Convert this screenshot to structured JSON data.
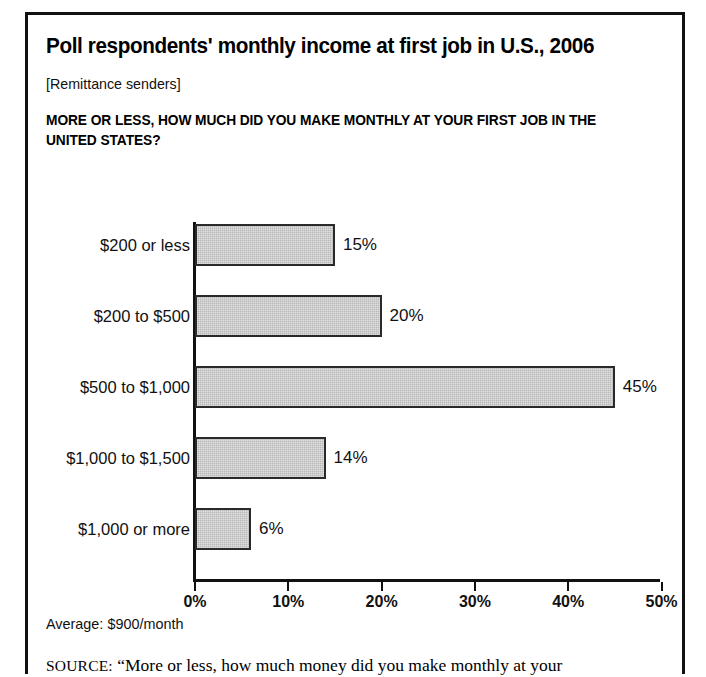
{
  "figure": {
    "title": "Poll respondents' monthly income at first job in U.S., 2006",
    "subtitle": "[Remittance senders]",
    "question": "MORE OR LESS, HOW MUCH DID YOU MAKE MONTHLY AT YOUR FIRST JOB IN THE UNITED STATES?",
    "average_note": "Average: $900/month",
    "source_label": "SOURCE:",
    "source_text": "“More or less, how much money did you make monthly at your"
  },
  "chart_data": {
    "type": "bar",
    "orientation": "horizontal",
    "title": "Poll respondents' monthly income at first job in U.S., 2006",
    "subtitle": "[Remittance senders]",
    "xlabel": "",
    "ylabel": "",
    "xlim": [
      0,
      50
    ],
    "grid": false,
    "legend": false,
    "bar_color": "#b9b9b9",
    "bar_border_color": "#2a2a2a",
    "categories": [
      "$200 or less",
      "$200 to $500",
      "$500 to $1,000",
      "$1,000 to $1,500",
      "$1,000 or more"
    ],
    "values": [
      15,
      20,
      45,
      14,
      6
    ],
    "value_labels": [
      "15%",
      "20%",
      "45%",
      "14%",
      "6%"
    ],
    "xticks": [
      0,
      10,
      20,
      30,
      40,
      50
    ],
    "xtick_labels": [
      "0%",
      "10%",
      "20%",
      "30%",
      "40%",
      "50%"
    ]
  }
}
